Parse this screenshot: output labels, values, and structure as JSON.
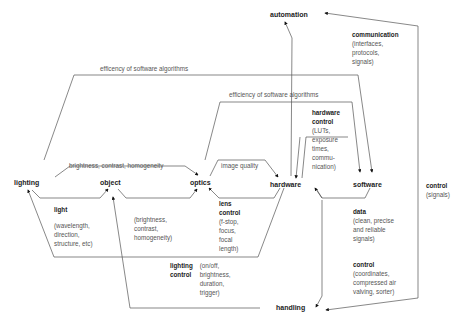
{
  "nodes": {
    "automation": "automation",
    "lighting": "lighting",
    "object": "object",
    "optics": "optics",
    "hardware": "hardware",
    "software": "software",
    "handling": "handling"
  },
  "edge_labels": {
    "outer_software": "efficency of software algorithms",
    "inner_software": "efficiency of software algorithms",
    "lighting_optics": "brightness, contrast, homogeneity",
    "image_quality": "image quality"
  },
  "annotations": {
    "communication": {
      "title": "communication",
      "desc": "(interfaces,\nprotocols,\nsignals)"
    },
    "hardware_control": {
      "title": "hardware control",
      "desc": "(LUTs,\nexposure\ntimes,\ncommu-\nnication)"
    },
    "light": {
      "title": "light",
      "desc": "(wavelength,\ndirection,\nstructure, etc)"
    },
    "object_props": {
      "title": "",
      "desc": "(brightness,\ncontrast,\nhomogeneity)"
    },
    "lens_control": {
      "title": "lens control",
      "desc": "(f-stop,\nfocus,\nfocal length)"
    },
    "lighting_control": {
      "title": "lighting control",
      "desc": "(on/off,\nbrightness,\nduration,\ntrigger)"
    },
    "data": {
      "title": "data",
      "desc": "(clean, precise\nand reliable\nsignals)"
    },
    "control_handling": {
      "title": "control",
      "desc": "(coordinates,\ncompressed air\nvalving, sorter)"
    },
    "control_signals": {
      "title": "control",
      "desc": "(signals)"
    }
  }
}
